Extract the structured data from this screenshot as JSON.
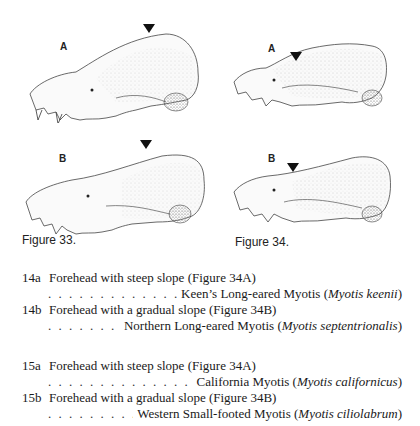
{
  "figures": [
    {
      "caption": "Figure 33.",
      "panels": [
        {
          "label": "A",
          "marker": "arrow-down"
        },
        {
          "label": "B",
          "marker": "arrow-down"
        }
      ]
    },
    {
      "caption": "Figure 34.",
      "panels": [
        {
          "label": "A",
          "marker": "arrow-down"
        },
        {
          "label": "B",
          "marker": "arrow-down"
        }
      ]
    }
  ],
  "key": [
    {
      "number": "14a",
      "description": "Forehead with steep slope (Figure 34A)",
      "common_name": "Keen’s Long-eared Myotis",
      "scientific_name": "Myotis keenii"
    },
    {
      "number": "14b",
      "description": "Forehead with a gradual slope (Figure 34B)",
      "common_name": "Northern Long-eared Myotis",
      "scientific_name": "Myotis septentrionalis"
    },
    {
      "number": "15a",
      "description": "Forehead with steep slope (Figure 34A)",
      "common_name": "California Myotis",
      "scientific_name": "Myotis californicus"
    },
    {
      "number": "15b",
      "description": "Forehead with a gradual slope (Figure 34B)",
      "common_name": "Western Small-footed Myotis",
      "scientific_name": "Myotis ciliolabrum"
    }
  ],
  "punct": {
    "open": " (",
    "close": ")"
  }
}
